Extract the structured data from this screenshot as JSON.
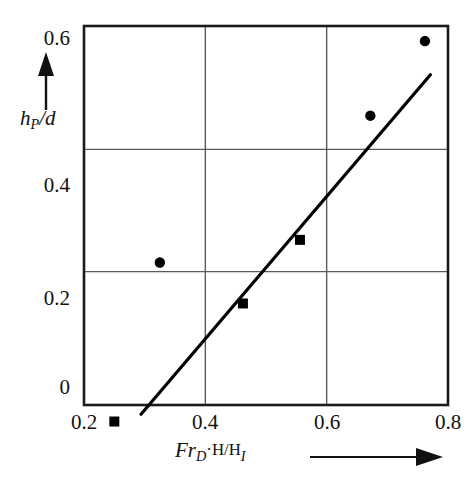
{
  "chart_data": {
    "type": "scatter",
    "title": "",
    "xlabel": "Fr_D·H/H_I",
    "ylabel": "h_P/d",
    "xlabel_parts": {
      "prefix": "Fr",
      "sub1": "D",
      "mid": "·H/H",
      "sub2": "I"
    },
    "ylabel_parts": {
      "prefix": "h",
      "sub1": "P",
      "suffix": "/d"
    },
    "xlim": [
      0.2,
      0.8
    ],
    "ylim": [
      -0.07,
      0.6
    ],
    "xticks": [
      0.2,
      0.4,
      0.6,
      0.8
    ],
    "xtick_labels": [
      "0.2",
      "0.4",
      "0.6",
      "0.8"
    ],
    "yticks": [
      0,
      0.2,
      0.4,
      0.6
    ],
    "ytick_labels": [
      "0",
      "0.2",
      "0.4",
      "0.6"
    ],
    "grid": true,
    "gridlines_x": [
      0.4,
      0.6
    ],
    "gridlines_y": [
      0.2,
      0.4
    ],
    "legend": null,
    "axis_arrows": {
      "x": true,
      "y": true
    },
    "series": [
      {
        "name": "squares",
        "marker": "square",
        "color": "#000000",
        "points": [
          {
            "x": 0.25,
            "y": -0.045
          },
          {
            "x": 0.462,
            "y": 0.148
          },
          {
            "x": 0.556,
            "y": 0.252
          }
        ]
      },
      {
        "name": "circles",
        "marker": "circle",
        "color": "#000000",
        "points": [
          {
            "x": 0.325,
            "y": 0.215
          },
          {
            "x": 0.672,
            "y": 0.455
          },
          {
            "x": 0.762,
            "y": 0.577
          }
        ]
      }
    ],
    "trendline": {
      "name": "fit-line",
      "color": "#000000",
      "x_start": 0.294,
      "y_start": -0.033,
      "x_end": 0.771,
      "y_end": 0.522
    }
  },
  "axes": {
    "frame_color": "#1a1a1a",
    "grid_color": "#5a5a5a"
  }
}
